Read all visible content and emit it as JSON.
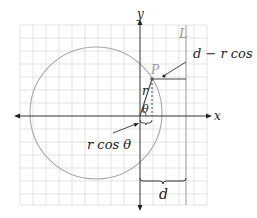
{
  "diagram": {
    "axes": {
      "x_label": "x",
      "y_label": "y"
    },
    "point_label": "P",
    "line_label": "L",
    "radius_label": "r",
    "angle_label": "θ",
    "annotations": {
      "top_right": "d − r cos θ",
      "left_bottom": "r cos θ",
      "brace": "d"
    },
    "colors": {
      "grid": "#d9d9d9",
      "circle": "#a8a8a8",
      "axis": "#333333",
      "line_L": "#b0b0b0",
      "text": "#222222",
      "point_label": "#9a9a9a"
    }
  }
}
